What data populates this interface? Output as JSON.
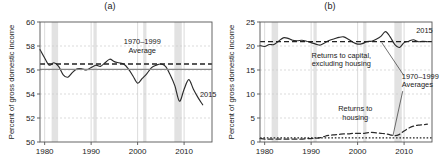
{
  "figure": {
    "panels": [
      {
        "id": "panel-a",
        "title": "(a)",
        "ylabel": "Percent of gross domestic income",
        "xlabel": "",
        "ylim": [
          50,
          60
        ],
        "xlim": [
          1979,
          2016
        ],
        "yticks": [
          "50",
          "52",
          "54",
          "56",
          "58",
          "60"
        ],
        "xticks": [
          "1980",
          "1990",
          "2000",
          "2010"
        ],
        "annotations": {
          "average_line1": "1970–1999",
          "average_line2": "Average",
          "endpoint": "2015"
        }
      },
      {
        "id": "panel-b",
        "title": "(b)",
        "ylabel": "Percent of gross domestic income",
        "xlabel": "",
        "ylim": [
          0,
          25
        ],
        "xlim": [
          1979,
          2016
        ],
        "yticks": [
          "0",
          "5",
          "10",
          "15",
          "20",
          "25"
        ],
        "xticks": [
          "1980",
          "1990",
          "2000",
          "2010"
        ],
        "annotations": {
          "capital_line1": "Returns to capital,",
          "capital_line2": "excluding housing",
          "housing_line1": "Returns to",
          "housing_line2": "housing",
          "averages_line1": "1970–1999",
          "averages_line2": "Averages",
          "endpoint": "2015"
        }
      }
    ],
    "colors": {
      "series": "#2b2b2b",
      "average": "#222222",
      "solid_reference": "#8a8a8a",
      "grid": "#cccccc",
      "recession_band": "#e2e2e2",
      "axis": "#555555"
    }
  },
  "chart_data": [
    {
      "type": "line",
      "id": "panel-a",
      "title": "(a)",
      "xlabel": "",
      "ylabel": "Percent of gross domestic income",
      "xlim": [
        1979,
        2016
      ],
      "ylim": [
        50,
        60
      ],
      "grid": true,
      "legend": "none",
      "x": [
        1979,
        1980,
        1981,
        1982,
        1983,
        1984,
        1985,
        1986,
        1987,
        1988,
        1989,
        1990,
        1991,
        1992,
        1993,
        1994,
        1995,
        1996,
        1997,
        1998,
        1999,
        2000,
        2001,
        2002,
        2003,
        2004,
        2005,
        2006,
        2007,
        2008,
        2009,
        2010,
        2011,
        2012,
        2013,
        2014,
        2015
      ],
      "series": [
        {
          "name": "Labor share of gross domestic income",
          "style": "solid",
          "values": [
            57.7,
            57.0,
            56.4,
            56.6,
            56.3,
            55.6,
            55.4,
            55.8,
            56.1,
            56.1,
            56.0,
            56.2,
            56.4,
            56.3,
            56.6,
            56.9,
            56.7,
            56.6,
            56.5,
            56.1,
            55.5,
            54.9,
            55.3,
            55.7,
            56.2,
            56.4,
            56.5,
            56.3,
            55.6,
            54.7,
            53.4,
            54.4,
            55.2,
            54.4,
            53.7,
            53.1,
            52.5,
            52.6,
            53.0
          ]
        },
        {
          "name": "1970–1999 Average",
          "style": "dashed",
          "constant": 56.5
        },
        {
          "name": "Reference level",
          "style": "solid-grey",
          "constant": 56.05
        }
      ],
      "recession_bands": [
        [
          1981.5,
          1982.9
        ],
        [
          1990.5,
          1991.2
        ],
        [
          2001.2,
          2001.9
        ],
        [
          2007.9,
          2009.5
        ]
      ],
      "annotations": [
        {
          "text": "1970–1999 Average",
          "x": 2000,
          "y": 58.0
        },
        {
          "text": "2015",
          "x": 2014.2,
          "y": 53.6
        }
      ]
    },
    {
      "type": "line",
      "id": "panel-b",
      "title": "(b)",
      "xlabel": "",
      "ylabel": "Percent of gross domestic income",
      "xlim": [
        1979,
        2016
      ],
      "ylim": [
        0,
        25
      ],
      "grid": true,
      "legend": "none",
      "x": [
        1979,
        1980,
        1981,
        1982,
        1983,
        1984,
        1985,
        1986,
        1987,
        1988,
        1989,
        1990,
        1991,
        1992,
        1993,
        1994,
        1995,
        1996,
        1997,
        1998,
        1999,
        2000,
        2001,
        2002,
        2003,
        2004,
        2005,
        2006,
        2007,
        2008,
        2009,
        2010,
        2011,
        2012,
        2013,
        2014,
        2015
      ],
      "series": [
        {
          "name": "Returns to capital, excluding housing",
          "style": "solid",
          "values": [
            20.1,
            19.9,
            20.3,
            20.3,
            21.0,
            21.7,
            21.6,
            21.2,
            21.1,
            21.2,
            21.0,
            20.7,
            20.4,
            20.2,
            20.7,
            21.2,
            21.5,
            21.8,
            21.9,
            21.4,
            20.8,
            20.4,
            20.5,
            20.9,
            21.0,
            21.4,
            22.0,
            23.0,
            21.9,
            20.3,
            19.7,
            20.7,
            21.0,
            21.3,
            20.9,
            21.0,
            20.9
          ]
        },
        {
          "name": "Returns to housing",
          "style": "dashed",
          "values": [
            0.7,
            0.6,
            0.6,
            0.6,
            0.6,
            0.6,
            0.6,
            0.6,
            0.6,
            0.6,
            0.7,
            0.7,
            0.8,
            0.9,
            1.2,
            1.4,
            1.5,
            1.6,
            1.7,
            1.7,
            1.8,
            1.8,
            1.8,
            1.9,
            2.0,
            1.9,
            1.8,
            1.7,
            1.5,
            1.3,
            1.6,
            2.3,
            2.9,
            3.3,
            3.5,
            3.6,
            3.7
          ]
        },
        {
          "name": "1970–1999 Average (capital)",
          "style": "dashed",
          "constant": 20.9
        },
        {
          "name": "1970–1999 Average (housing)",
          "style": "dotted",
          "constant": 0.85
        }
      ],
      "recession_bands": [
        [
          1981.5,
          1982.9
        ],
        [
          1990.5,
          1991.2
        ],
        [
          2001.2,
          2001.9
        ],
        [
          2007.9,
          2009.5
        ]
      ],
      "annotations": [
        {
          "text": "Returns to capital, excluding housing",
          "x": 1996,
          "y": 17.0
        },
        {
          "text": "Returns to housing",
          "x": 2000,
          "y": 6.0
        },
        {
          "text": "1970–1999 Averages",
          "x": 2013,
          "y": 13.0
        },
        {
          "text": "2015",
          "x": 2014,
          "y": 22.8
        }
      ]
    }
  ]
}
